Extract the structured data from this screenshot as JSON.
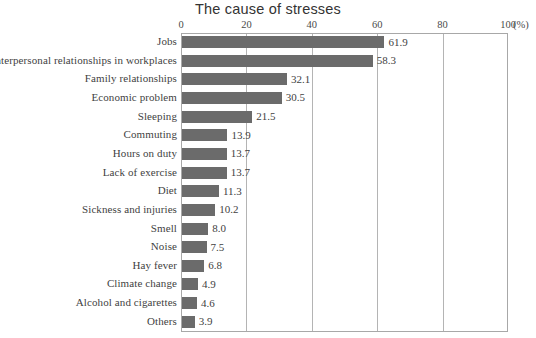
{
  "chart_data": {
    "type": "bar",
    "orientation": "horizontal",
    "title": "The cause of stresses",
    "xlabel": "(%)",
    "ylabel": "",
    "xlim": [
      0,
      100
    ],
    "xticks": [
      0,
      20,
      40,
      60,
      80,
      100
    ],
    "xtick_labels": [
      "0",
      "20",
      "40",
      "60",
      "80",
      "100"
    ],
    "unit_label": "(%)",
    "grid": true,
    "grid_axis": "x",
    "legend": false,
    "bar_color": "#6b6b6b",
    "categories": [
      "Jobs",
      "Interpersonal relationships in workplaces",
      "Family relationships",
      "Economic problem",
      "Sleeping",
      "Commuting",
      "Hours on duty",
      "Lack of exercise",
      "Diet",
      "Sickness and injuries",
      "Smell",
      "Noise",
      "Hay fever",
      "Climate change",
      "Alcohol and cigarettes",
      "Others"
    ],
    "values": [
      61.9,
      58.3,
      32.1,
      30.5,
      21.5,
      13.9,
      13.7,
      13.7,
      11.3,
      10.2,
      8.0,
      7.5,
      6.8,
      4.9,
      4.6,
      3.9
    ],
    "value_labels": [
      "61.9",
      "58.3",
      "32.1",
      "30.5",
      "21.5",
      "13.9",
      "13.7",
      "13.7",
      "11.3",
      "10.2",
      "8.0",
      "7.5",
      "6.8",
      "4.9",
      "4.6",
      "3.9"
    ]
  }
}
